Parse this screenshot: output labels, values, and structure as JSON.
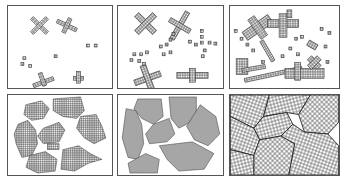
{
  "figure": {
    "stroke_color": "#333333",
    "background": "#ffffff",
    "panels": [
      {
        "id": "stage-1",
        "row": 0,
        "col": 0,
        "x": 7,
        "y": 5,
        "w": 106,
        "h": 84,
        "stage": "isolated nuclei and small cross-shaped crystals"
      },
      {
        "id": "stage-2",
        "row": 0,
        "col": 1,
        "x": 117,
        "y": 5,
        "w": 107,
        "h": 84,
        "stage": "cross-shaped crystals grow, more nuclei appear"
      },
      {
        "id": "stage-3",
        "row": 0,
        "col": 2,
        "x": 229,
        "y": 5,
        "w": 111,
        "h": 84,
        "stage": "many growing dendritic crystals"
      },
      {
        "id": "stage-4",
        "row": 1,
        "col": 0,
        "x": 7,
        "y": 94,
        "w": 106,
        "h": 82,
        "stage": "crystals form irregular grain clusters"
      },
      {
        "id": "stage-5",
        "row": 1,
        "col": 1,
        "x": 117,
        "y": 94,
        "w": 107,
        "h": 82,
        "stage": "grains nearly fill the volume"
      },
      {
        "id": "stage-6",
        "row": 1,
        "col": 2,
        "x": 229,
        "y": 94,
        "w": 111,
        "h": 82,
        "stage": "fully solidified polycrystal with grain boundaries"
      }
    ]
  }
}
